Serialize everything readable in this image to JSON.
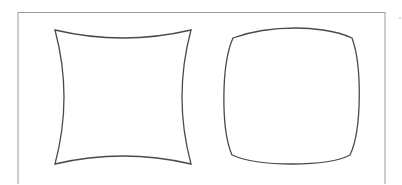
{
  "diagram": {
    "background": "#ffffff",
    "frame": {
      "stroke": "#9a9a9a",
      "x": 18,
      "y": 12.5,
      "width": 367,
      "height": 180
    },
    "stroke_color": "#4a4a4a",
    "shapes": [
      {
        "name": "pincushion-square",
        "description": "square with concave (inward-curved) edges",
        "path": "M55,30 Q123,46 191,30 Q173,97 191,164 Q123,148 55,164 Q73,97 55,30 Z"
      },
      {
        "name": "barrel-square",
        "description": "square with convex (outward-bulging) edges",
        "path": "M233,38 C260,28 290,28 296,28 C310,28 335,30 352,38 C362,65 362,130 350,155 C335,163 310,164 292,164 C275,164 250,163 232,155 C221,130 221,65 233,38 Z"
      }
    ],
    "edge_mark": {
      "x": 400,
      "y": 18
    }
  }
}
